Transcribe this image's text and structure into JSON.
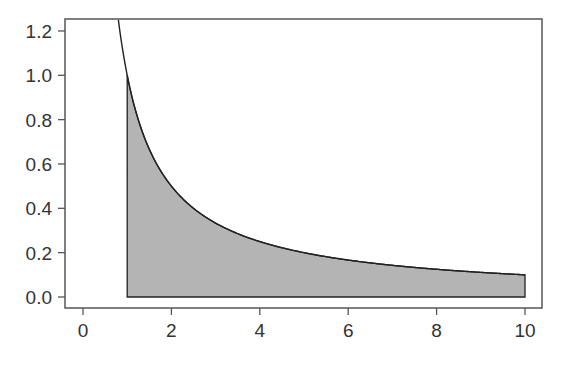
{
  "chart_data": {
    "type": "area",
    "title": "",
    "xlabel": "",
    "ylabel": "",
    "function": "y = 1/x",
    "xlim": [
      -0.4,
      10.4
    ],
    "ylim": [
      -0.05,
      1.25
    ],
    "grid": false,
    "legend": null,
    "x_ticks": [
      0,
      2,
      4,
      6,
      8,
      10
    ],
    "x_tick_labels": [
      "0",
      "2",
      "4",
      "6",
      "8",
      "10"
    ],
    "y_ticks": [
      0.0,
      0.2,
      0.4,
      0.6,
      0.8,
      1.0,
      1.2
    ],
    "y_tick_labels": [
      "0.0",
      "0.2",
      "0.4",
      "0.6",
      "0.8",
      "1.0",
      "1.2"
    ],
    "series": [
      {
        "name": "curve",
        "x": [
          0.8,
          1,
          1.5,
          2,
          3,
          4,
          5,
          6,
          7,
          8,
          9,
          10
        ],
        "values": [
          1.25,
          1.0,
          0.667,
          0.5,
          0.333,
          0.25,
          0.2,
          0.167,
          0.143,
          0.125,
          0.111,
          0.1
        ]
      }
    ],
    "shaded_region": {
      "x_from": 1,
      "x_to": 10,
      "under": "y = 1/x",
      "color": "#b4b4b4"
    },
    "colors": {
      "line": "#222222",
      "fill": "#b4b4b4",
      "axis": "#555555",
      "background": "#ffffff"
    }
  }
}
